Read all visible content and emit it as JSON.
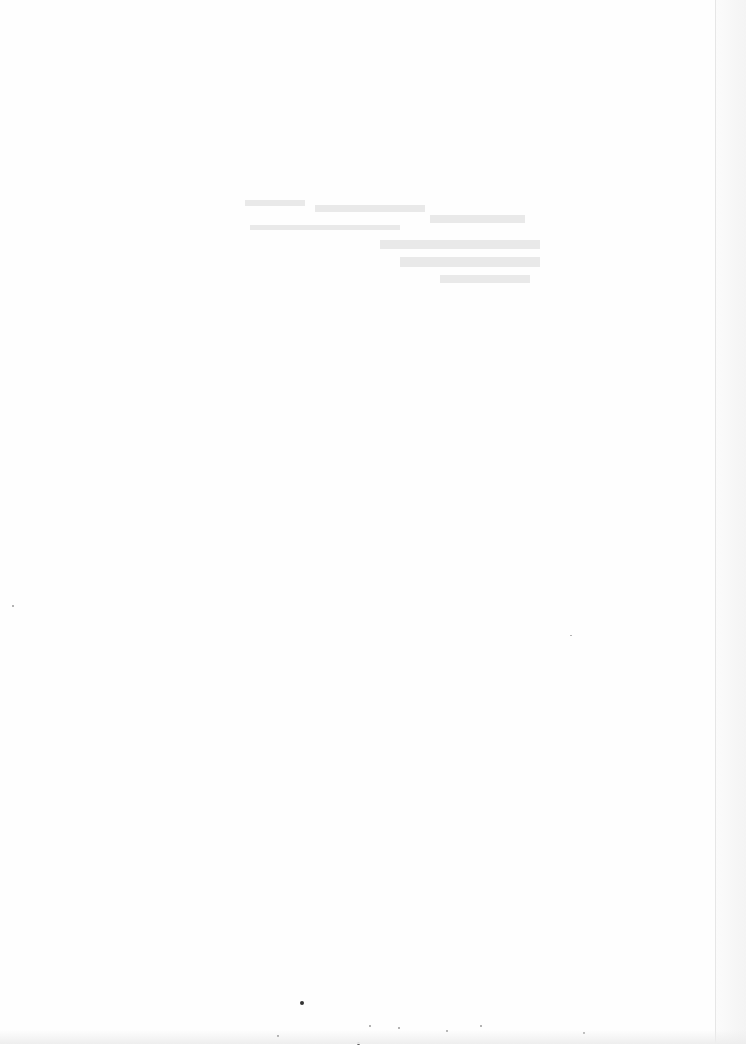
{
  "page": {
    "type": "blank scanned page",
    "visible_text": "",
    "background_color": "#fefefe",
    "bleed_through_text_regions": [
      {
        "x": 240,
        "y": 195,
        "width": 300,
        "height": 60
      },
      {
        "x": 370,
        "y": 230,
        "width": 170,
        "height": 60
      }
    ]
  }
}
